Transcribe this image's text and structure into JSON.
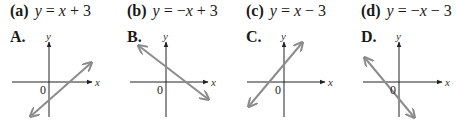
{
  "problems": [
    {
      "tag": "(a)",
      "lhs": "y",
      "rhs": "x + 3",
      "rhs_parts": [
        "",
        "x",
        " + 3"
      ],
      "choice": "A.",
      "graph": {
        "y_axis_x": 49,
        "x_axis_y": 82,
        "x_from": 12,
        "x_to": 92,
        "y_from": 42,
        "y_to": 117,
        "line": [
          31,
          116,
          91,
          63
        ]
      }
    },
    {
      "tag": "(b)",
      "lhs": "y",
      "rhs": "−x + 3",
      "rhs_parts": [
        "−",
        "x",
        " + 3"
      ],
      "choice": "B.",
      "graph": {
        "y_axis_x": 166,
        "x_axis_y": 82,
        "x_from": 130,
        "x_to": 208,
        "y_from": 42,
        "y_to": 117,
        "line": [
          139,
          46,
          208,
          99
        ]
      }
    },
    {
      "tag": "(c)",
      "lhs": "y",
      "rhs": "x − 3",
      "rhs_parts": [
        "",
        "x",
        " − 3"
      ],
      "choice": "C.",
      "graph": {
        "y_axis_x": 284,
        "x_axis_y": 82,
        "x_from": 247,
        "x_to": 325,
        "y_from": 42,
        "y_to": 117,
        "line": [
          249,
          106,
          302,
          43
        ]
      }
    },
    {
      "tag": "(d)",
      "lhs": "y",
      "rhs": "−x − 3",
      "rhs_parts": [
        "−",
        "x",
        " − 3"
      ],
      "choice": "D.",
      "graph": {
        "y_axis_x": 399,
        "x_axis_y": 82,
        "x_from": 363,
        "x_to": 442,
        "y_from": 42,
        "y_to": 117,
        "line": [
          365,
          58,
          414,
          117
        ]
      }
    }
  ],
  "axis_labels": {
    "x": "x",
    "y": "y",
    "origin": "0"
  },
  "colors": {
    "axis": "#222222",
    "line": "#8c8c8c"
  }
}
